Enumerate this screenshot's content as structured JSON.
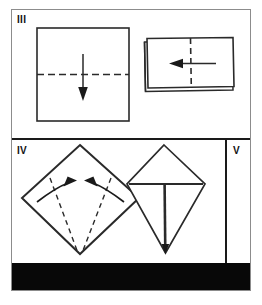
{
  "figure": {
    "kind": "origami-folding-instruction-diagram",
    "panels": [
      {
        "id": "panel-three",
        "step_label": "III",
        "diagrams": [
          {
            "name": "square-sheet-with-horizontal-fold",
            "shape": "square",
            "fold_line": "horizontal-dashed-center",
            "arrow": "down-arrow",
            "arrow_direction": "down"
          },
          {
            "name": "folded-rectangle-with-vertical-fold",
            "shape": "rectangle-folded-layers",
            "fold_line": "vertical-dashed-center",
            "arrow": "left-arrow",
            "arrow_direction": "left"
          }
        ]
      },
      {
        "id": "panel-four",
        "step_label": "IV",
        "diagrams": [
          {
            "name": "diamond-with-converging-folds",
            "shape": "diamond",
            "fold_line": "two-dashed-lines-to-bottom-vertex",
            "arrows": [
              "curved-arrow-right",
              "curved-arrow-left"
            ],
            "arrow_direction": "inward"
          },
          {
            "name": "kite-shape-result",
            "shape": "kite",
            "fold_line": "horizontal-and-vertical-center-creases",
            "arrows": []
          }
        ]
      },
      {
        "id": "panel-five",
        "step_label": "V",
        "diagrams": []
      }
    ]
  },
  "colors": {
    "ink": "#1a1a1a",
    "frame": "#8c8c8c",
    "paper": "#ffffff",
    "bar": "#080808"
  }
}
